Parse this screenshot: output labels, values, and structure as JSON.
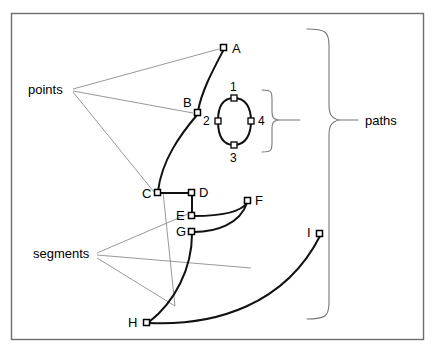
{
  "figure": {
    "colors": {
      "frame": "#6e6e6e",
      "curve": "#111111",
      "leader": "#8d8d8d",
      "brace": "#777777",
      "node_fill": "#ffffff",
      "node_stroke": "#000000"
    }
  },
  "group_labels": {
    "points": "points",
    "segments": "segments",
    "paths": "paths"
  },
  "point_labels": {
    "a": "A",
    "b": "B",
    "c": "C",
    "d": "D",
    "e": "E",
    "f": "F",
    "g": "G",
    "h": "H",
    "i": "I"
  },
  "oval_labels": {
    "top": "1",
    "left": "2",
    "bottom": "3",
    "right": "4"
  },
  "nodes": [
    {
      "id": "A",
      "label": "A",
      "x": 224,
      "y": 48
    },
    {
      "id": "B",
      "label": "B",
      "x": 198,
      "y": 113
    },
    {
      "id": "C",
      "label": "C",
      "x": 158,
      "y": 193
    },
    {
      "id": "D",
      "label": "D",
      "x": 192,
      "y": 193
    },
    {
      "id": "E",
      "label": "E",
      "x": 192,
      "y": 216
    },
    {
      "id": "F",
      "label": "F",
      "x": 248,
      "y": 201
    },
    {
      "id": "G",
      "label": "G",
      "x": 192,
      "y": 232
    },
    {
      "id": "H",
      "label": "H",
      "x": 147,
      "y": 323
    },
    {
      "id": "I",
      "label": "I",
      "x": 320,
      "y": 234
    },
    {
      "id": "1",
      "label": "1",
      "x": 234,
      "y": 98
    },
    {
      "id": "2",
      "label": "2",
      "x": 218,
      "y": 121
    },
    {
      "id": "3",
      "label": "3",
      "x": 234,
      "y": 145
    },
    {
      "id": "4",
      "label": "4",
      "x": 251,
      "y": 121
    }
  ]
}
